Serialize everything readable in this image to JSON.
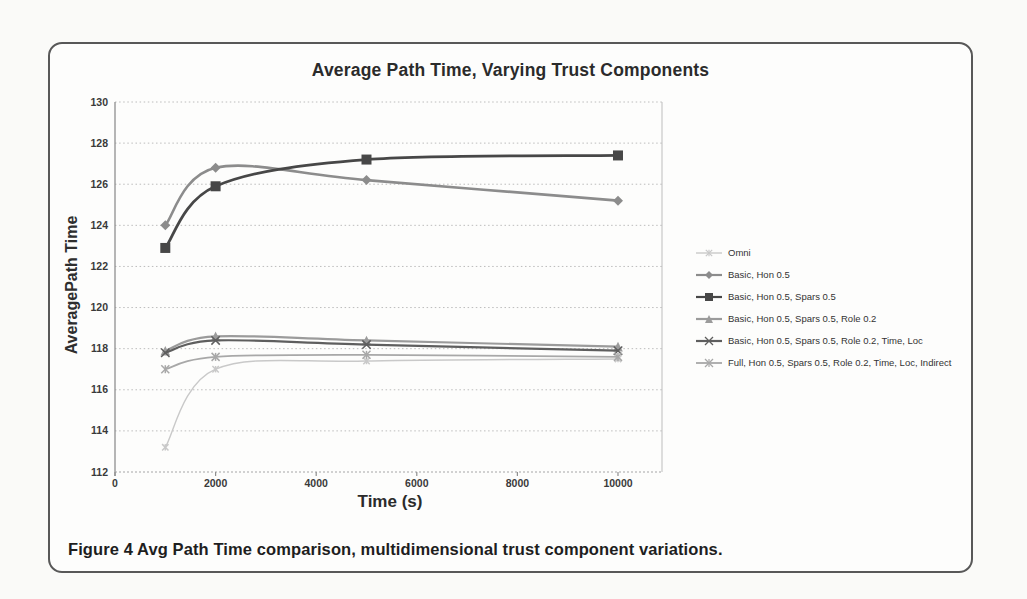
{
  "page": {
    "caption": "Figure 4 Avg Path Time comparison, multidimensional trust component variations."
  },
  "chart_data": {
    "type": "line",
    "title": "Average Path Time, Varying Trust Components",
    "xlabel": "Time (s)",
    "ylabel": "AveragePath Time",
    "x": [
      1000,
      2000,
      5000,
      10000
    ],
    "xlim": [
      0,
      10875
    ],
    "ylim": [
      112,
      130
    ],
    "x_ticks": [
      0,
      2000,
      4000,
      6000,
      8000,
      10000
    ],
    "y_ticks": [
      112,
      114,
      116,
      118,
      120,
      122,
      124,
      126,
      128,
      130
    ],
    "grid": "horizontal-dotted",
    "legend_position": "right",
    "line_style": "smoothed",
    "series": [
      {
        "name": "Omni",
        "values": [
          113.2,
          117.0,
          117.4,
          117.5
        ],
        "color": "#c9c9c9",
        "marker": "star"
      },
      {
        "name": "Basic, Hon 0.5",
        "values": [
          124.0,
          126.8,
          126.2,
          125.2
        ],
        "color": "#8c8c8c",
        "marker": "diamond"
      },
      {
        "name": "Basic, Hon 0.5, Spars 0.5",
        "values": [
          122.9,
          125.9,
          127.2,
          127.4
        ],
        "color": "#474747",
        "marker": "square"
      },
      {
        "name": "Basic, Hon 0.5, Spars 0.5, Role 0.2",
        "values": [
          117.9,
          118.6,
          118.4,
          118.1
        ],
        "color": "#9b9b9b",
        "marker": "triangle"
      },
      {
        "name": "Basic, Hon 0.5, Spars 0.5, Role 0.2, Time, Loc",
        "values": [
          117.8,
          118.4,
          118.2,
          117.9
        ],
        "color": "#5e5e5e",
        "marker": "x"
      },
      {
        "name": "Full, Hon 0.5, Spars 0.5, Role 0.2, Time, Loc, Indirect",
        "values": [
          117.0,
          117.6,
          117.7,
          117.6
        ],
        "color": "#a8a8a8",
        "marker": "star"
      }
    ]
  }
}
